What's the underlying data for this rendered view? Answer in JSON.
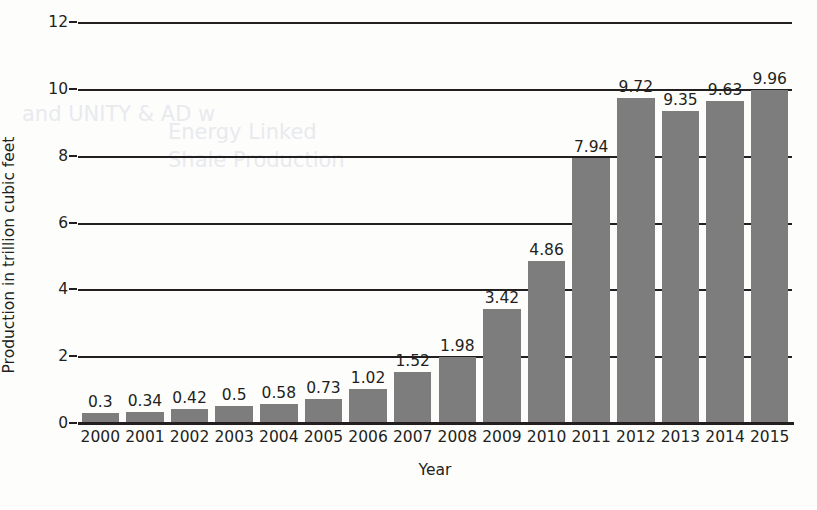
{
  "figure": {
    "background_color": "#fdfdfc",
    "bar_color": "#7d7d7d",
    "axis_color": "#231f20"
  },
  "axes": {
    "y_title": "Production in trillion cubic feet",
    "x_title": "Year"
  },
  "chart_data": {
    "type": "bar",
    "title": "",
    "subtitle": "",
    "xlabel": "Year",
    "ylabel": "Production in trillion cubic feet",
    "categories": [
      "2000",
      "2001",
      "2002",
      "2003",
      "2004",
      "2005",
      "2006",
      "2007",
      "2008",
      "2009",
      "2010",
      "2011",
      "2012",
      "2013",
      "2014",
      "2015"
    ],
    "values": [
      0.3,
      0.34,
      0.42,
      0.5,
      0.58,
      0.73,
      1.02,
      1.52,
      1.98,
      3.42,
      4.86,
      7.94,
      9.72,
      9.35,
      9.63,
      9.96
    ],
    "value_labels": [
      "0.3",
      "0.34",
      "0.42",
      "0.5",
      "0.58",
      "0.73",
      "1.02",
      "1.52",
      "1.98",
      "3.42",
      "4.86",
      "7.94",
      "9.72",
      "9.35",
      "9.63",
      "9.96"
    ],
    "ylim": [
      0,
      12
    ],
    "y_ticks": [
      0,
      2,
      4,
      6,
      8,
      10,
      12
    ],
    "y_tick_labels": [
      "0",
      "2",
      "4",
      "6",
      "8",
      "10",
      "12"
    ],
    "grid": true,
    "grid_axis": "y",
    "legend": false,
    "legend_position": "none",
    "series": [
      {
        "name": "Production",
        "values": [
          0.3,
          0.34,
          0.42,
          0.5,
          0.58,
          0.73,
          1.02,
          1.52,
          1.98,
          3.42,
          4.86,
          7.94,
          9.72,
          9.35,
          9.63,
          9.96
        ]
      }
    ]
  },
  "ghost_text": {
    "lines": [
      "and UNITY & AD w",
      "Energy Linked",
      "Shale Production"
    ]
  }
}
